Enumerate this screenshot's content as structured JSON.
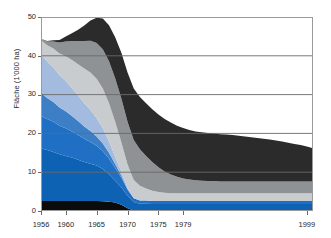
{
  "chart_data": {
    "type": "area",
    "stacked": true,
    "title": "",
    "xlabel": "",
    "ylabel": "Fläche (1'000 ha)",
    "xlim": [
      1956,
      2000
    ],
    "ylim": [
      0,
      50
    ],
    "yticks": [
      0,
      10,
      20,
      30,
      40,
      50
    ],
    "ytick_labels": [
      "0",
      "10",
      "20",
      "30",
      "40",
      "50"
    ],
    "xticks": [
      1956,
      1960,
      1965,
      1970,
      1975,
      1979,
      1999
    ],
    "xtick_labels": [
      "1956",
      "1960",
      "1965",
      "1970",
      "1975",
      "1979",
      "1999"
    ],
    "grid": "horizontal",
    "legend": "none",
    "x": [
      1956,
      1957,
      1958,
      1959,
      1960,
      1961,
      1962,
      1963,
      1964,
      1965,
      1966,
      1967,
      1968,
      1969,
      1970,
      1971,
      1972,
      1973,
      1974,
      1975,
      1976,
      1977,
      1978,
      1979,
      1980,
      1981,
      1982,
      1983,
      1984,
      1985,
      1986,
      1987,
      1988,
      1989,
      1990,
      1991,
      1992,
      1993,
      1994,
      1995,
      1996,
      1997,
      1998,
      1999,
      2000
    ],
    "series": [
      {
        "name": "black-band",
        "color": "#0b0b0b",
        "values": [
          2.6,
          2.6,
          2.6,
          2.6,
          2.6,
          2.6,
          2.6,
          2.6,
          2.6,
          2.6,
          2.5,
          2.4,
          2.2,
          1.6,
          0.7,
          0.1,
          0.0,
          0.0,
          0.0,
          0.0,
          0.0,
          0.0,
          0.0,
          0.0,
          0.0,
          0.0,
          0.0,
          0.0,
          0.0,
          0.0,
          0.0,
          0.0,
          0.0,
          0.0,
          0.0,
          0.0,
          0.0,
          0.0,
          0.0,
          0.0,
          0.0,
          0.0,
          0.0,
          0.0,
          0.0
        ]
      },
      {
        "name": "bright-blue-band",
        "color": "#0e62b3",
        "values": [
          13.6,
          13.1,
          12.6,
          12.0,
          11.6,
          11.2,
          10.6,
          10.0,
          9.6,
          9.1,
          8.3,
          7.1,
          5.6,
          4.5,
          3.2,
          2.2,
          1.9,
          1.9,
          1.8,
          1.8,
          1.8,
          1.8,
          1.8,
          1.8,
          1.8,
          1.8,
          1.8,
          1.8,
          1.8,
          1.8,
          1.8,
          1.8,
          1.8,
          1.8,
          1.8,
          1.8,
          1.8,
          1.8,
          1.8,
          1.8,
          1.8,
          1.8,
          1.8,
          1.8,
          1.8
        ]
      },
      {
        "name": "medium-blue-band",
        "color": "#1f6fc4",
        "values": [
          8.3,
          8.0,
          7.8,
          7.4,
          7.1,
          6.7,
          6.4,
          6.0,
          5.6,
          5.1,
          4.6,
          4.0,
          3.3,
          2.5,
          1.6,
          1.0,
          0.8,
          0.8,
          0.8,
          0.8,
          0.8,
          0.8,
          0.8,
          0.8,
          0.8,
          0.8,
          0.8,
          0.8,
          0.8,
          0.8,
          0.8,
          0.8,
          0.8,
          0.8,
          0.8,
          0.8,
          0.8,
          0.8,
          0.8,
          0.8,
          0.8,
          0.8,
          0.8,
          0.8,
          0.8
        ]
      },
      {
        "name": "steel-blue-band",
        "color": "#3d7fc6",
        "values": [
          5.9,
          5.4,
          5.1,
          4.7,
          4.4,
          4.0,
          3.6,
          3.2,
          2.8,
          2.4,
          2.0,
          1.5,
          1.0,
          0.5,
          0.2,
          0.0,
          0.0,
          0.0,
          0.0,
          0.0,
          0.0,
          0.0,
          0.0,
          0.0,
          0.0,
          0.0,
          0.0,
          0.0,
          0.0,
          0.0,
          0.0,
          0.0,
          0.0,
          0.0,
          0.0,
          0.0,
          0.0,
          0.0,
          0.0,
          0.0,
          0.0,
          0.0,
          0.0,
          0.0,
          0.0
        ]
      },
      {
        "name": "light-blue-band",
        "color": "#a3bbdf",
        "values": [
          10.0,
          9.4,
          8.9,
          8.3,
          7.8,
          7.2,
          6.6,
          6.0,
          5.4,
          4.7,
          3.9,
          2.9,
          1.9,
          1.0,
          0.3,
          0.0,
          0.0,
          0.0,
          0.0,
          0.0,
          0.0,
          0.0,
          0.0,
          0.0,
          0.0,
          0.0,
          0.0,
          0.0,
          0.0,
          0.0,
          0.0,
          0.0,
          0.0,
          0.0,
          0.0,
          0.0,
          0.0,
          0.0,
          0.0,
          0.0,
          0.0,
          0.0,
          0.0,
          0.0,
          0.0
        ]
      },
      {
        "name": "light-gray-band",
        "color": "#c9ccce",
        "values": [
          3.6,
          4.2,
          4.9,
          5.6,
          6.4,
          7.2,
          8.0,
          8.9,
          9.7,
          10.2,
          10.3,
          9.9,
          9.0,
          7.6,
          6.0,
          4.7,
          3.8,
          3.1,
          2.6,
          2.3,
          2.1,
          2.0,
          2.0,
          2.0,
          2.0,
          2.0,
          2.0,
          2.0,
          2.0,
          2.0,
          2.0,
          2.0,
          2.0,
          2.0,
          2.0,
          2.0,
          2.0,
          2.0,
          2.0,
          2.0,
          2.0,
          2.0,
          2.0,
          2.0,
          2.0
        ]
      },
      {
        "name": "medium-gray-band",
        "color": "#8e9295",
        "values": [
          0.4,
          1.0,
          1.8,
          2.8,
          3.8,
          4.9,
          6.0,
          7.1,
          8.2,
          9.2,
          10.1,
          10.8,
          11.2,
          11.3,
          11.0,
          10.3,
          9.4,
          8.4,
          7.4,
          6.4,
          5.5,
          4.8,
          4.2,
          3.8,
          3.5,
          3.3,
          3.2,
          3.1,
          3.1,
          3.0,
          3.0,
          3.0,
          3.0,
          3.0,
          3.0,
          3.0,
          3.0,
          3.0,
          3.0,
          3.0,
          3.0,
          3.0,
          3.0,
          3.0,
          3.0
        ]
      },
      {
        "name": "dark-charcoal-band",
        "color": "#2b2b2b",
        "values": [
          0.0,
          0.1,
          0.3,
          0.7,
          1.3,
          2.0,
          2.9,
          4.0,
          5.2,
          6.5,
          7.9,
          9.3,
          10.6,
          11.8,
          12.7,
          13.3,
          13.5,
          13.6,
          13.6,
          13.6,
          13.5,
          13.4,
          13.2,
          13.0,
          12.8,
          12.6,
          12.5,
          12.4,
          12.3,
          12.2,
          12.1,
          12.0,
          11.8,
          11.6,
          11.4,
          11.2,
          11.0,
          10.8,
          10.6,
          10.3,
          10.0,
          9.7,
          9.4,
          9.0,
          8.6
        ]
      }
    ],
    "totals": [
      44.4,
      43.8,
      44.0,
      44.1,
      43.0,
      42.0,
      43.2,
      42.6,
      43.4,
      42.0,
      41.0,
      40.0,
      39.9,
      39.5,
      39.2,
      38.0,
      37.0,
      36.5,
      36.0,
      35.5,
      35.0,
      34.8,
      34.5,
      34.3,
      34.0,
      33.8,
      33.6,
      33.4,
      33.2,
      33.0,
      32.9,
      32.8,
      32.6,
      32.4,
      32.2,
      32.0,
      31.8,
      31.6,
      31.4,
      31.2,
      31.0,
      30.8,
      30.6,
      30.4,
      30.2
    ]
  },
  "axes": {
    "ylabel": "Fläche (1'000 ha)"
  },
  "colors": {
    "grid": "#6a6a6a",
    "frame": "#9a9a9a",
    "background": "#ffffff",
    "text": "#2a2a2a"
  }
}
